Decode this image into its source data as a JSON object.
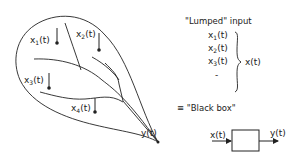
{
  "diagram": {
    "catchment": {
      "inputs": [
        {
          "label": "x",
          "sub": "1",
          "arg": "(t)"
        },
        {
          "label": "x",
          "sub": "2",
          "arg": "(t)"
        },
        {
          "label": "x",
          "sub": "3",
          "arg": "(t)"
        },
        {
          "label": "x",
          "sub": "4",
          "arg": "(t)"
        }
      ],
      "output_label": "y(t)"
    },
    "lumped": {
      "heading": "\"Lumped\" input",
      "items": [
        {
          "label": "x",
          "sub": "1",
          "arg": "(t)"
        },
        {
          "label": "x",
          "sub": "2",
          "arg": "(t)"
        },
        {
          "label": "x",
          "sub": "3",
          "arg": "(t)"
        }
      ],
      "ellipsis": "-",
      "result": "x(t)"
    },
    "equivalence": "≡ \"Black box\"",
    "blackbox": {
      "input_label": "x(t)",
      "output_label": "y(t)"
    },
    "colors": {
      "ink": "#222222",
      "background": "#ffffff"
    }
  }
}
